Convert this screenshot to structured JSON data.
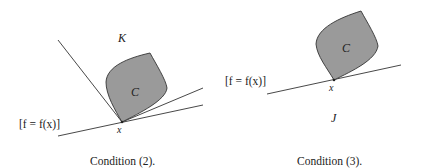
{
  "panels": [
    {
      "id": "condition-2",
      "caption": "Condition (2).",
      "set_label": "C",
      "cone_label": "K",
      "point_label": "x",
      "level_set_label": "[f = f(x)]",
      "lines": [
        {
          "name": "cone-edge-left",
          "x1": 58,
          "y1": 40,
          "x2": 122,
          "y2": 122
        },
        {
          "name": "level-line",
          "x1": 58,
          "y1": 136,
          "x2": 203,
          "y2": 105
        },
        {
          "name": "cone-edge-right",
          "x1": 122,
          "y1": 122,
          "x2": 203,
          "y2": 88
        }
      ]
    },
    {
      "id": "condition-3",
      "caption": "Condition (3).",
      "set_label": "C",
      "halfspace_label": "J",
      "point_label": "x",
      "level_set_label": "[f = f(x)]",
      "lines": [
        {
          "name": "level-line",
          "x1": 267,
          "y1": 94,
          "x2": 401,
          "y2": 65
        }
      ]
    }
  ],
  "colors": {
    "set_fill": "#9a9a9a",
    "stroke": "#333333",
    "background": "#ffffff"
  }
}
